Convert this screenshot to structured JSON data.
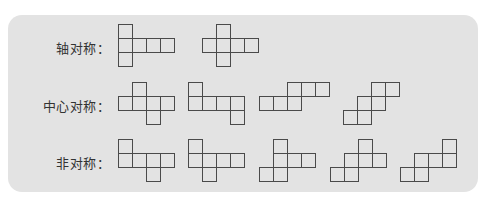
{
  "cell_size": 14,
  "rows": [
    {
      "label": "轴对称：",
      "label_pos": {
        "x": 0,
        "y": 37
      },
      "figures": [
        {
          "x": 118,
          "y": 24,
          "cells": [
            [
              0,
              0
            ],
            [
              0,
              1
            ],
            [
              1,
              1
            ],
            [
              2,
              1
            ],
            [
              3,
              1
            ],
            [
              0,
              2
            ]
          ]
        },
        {
          "x": 202,
          "y": 24,
          "cells": [
            [
              1,
              0
            ],
            [
              0,
              1
            ],
            [
              1,
              1
            ],
            [
              2,
              1
            ],
            [
              3,
              1
            ],
            [
              1,
              2
            ]
          ]
        }
      ]
    },
    {
      "label": "中心对称：",
      "label_pos": {
        "x": 0,
        "y": 95
      },
      "figures": [
        {
          "x": 118,
          "y": 82,
          "cells": [
            [
              1,
              0
            ],
            [
              0,
              1
            ],
            [
              1,
              1
            ],
            [
              2,
              1
            ],
            [
              3,
              1
            ],
            [
              2,
              2
            ]
          ]
        },
        {
          "x": 188,
          "y": 82,
          "cells": [
            [
              0,
              0
            ],
            [
              0,
              1
            ],
            [
              1,
              1
            ],
            [
              2,
              1
            ],
            [
              3,
              1
            ],
            [
              3,
              2
            ]
          ]
        },
        {
          "x": 259,
          "y": 82,
          "cells": [
            [
              2,
              0
            ],
            [
              3,
              0
            ],
            [
              4,
              0
            ],
            [
              0,
              1
            ],
            [
              1,
              1
            ],
            [
              2,
              1
            ]
          ]
        },
        {
          "x": 343,
          "y": 82,
          "cells": [
            [
              2,
              0
            ],
            [
              3,
              0
            ],
            [
              1,
              1
            ],
            [
              2,
              1
            ],
            [
              0,
              2
            ],
            [
              1,
              2
            ]
          ]
        }
      ]
    },
    {
      "label": "非对称：",
      "label_pos": {
        "x": 0,
        "y": 152
      },
      "figures": [
        {
          "x": 118,
          "y": 139,
          "cells": [
            [
              0,
              0
            ],
            [
              0,
              1
            ],
            [
              1,
              1
            ],
            [
              2,
              1
            ],
            [
              3,
              1
            ],
            [
              2,
              2
            ]
          ]
        },
        {
          "x": 188,
          "y": 139,
          "cells": [
            [
              0,
              0
            ],
            [
              0,
              1
            ],
            [
              1,
              1
            ],
            [
              2,
              1
            ],
            [
              3,
              1
            ],
            [
              1,
              2
            ]
          ]
        },
        {
          "x": 259,
          "y": 139,
          "cells": [
            [
              1,
              0
            ],
            [
              1,
              1
            ],
            [
              2,
              1
            ],
            [
              3,
              1
            ],
            [
              0,
              2
            ],
            [
              1,
              2
            ]
          ]
        },
        {
          "x": 330,
          "y": 139,
          "cells": [
            [
              2,
              0
            ],
            [
              1,
              1
            ],
            [
              2,
              1
            ],
            [
              3,
              1
            ],
            [
              0,
              2
            ],
            [
              1,
              2
            ]
          ]
        },
        {
          "x": 400,
          "y": 139,
          "cells": [
            [
              3,
              0
            ],
            [
              1,
              1
            ],
            [
              2,
              1
            ],
            [
              3,
              1
            ],
            [
              0,
              2
            ],
            [
              1,
              2
            ]
          ]
        }
      ]
    }
  ],
  "colors": {
    "panel": "#e3e3e3",
    "line": "#4a4a4a",
    "text": "#333333"
  }
}
